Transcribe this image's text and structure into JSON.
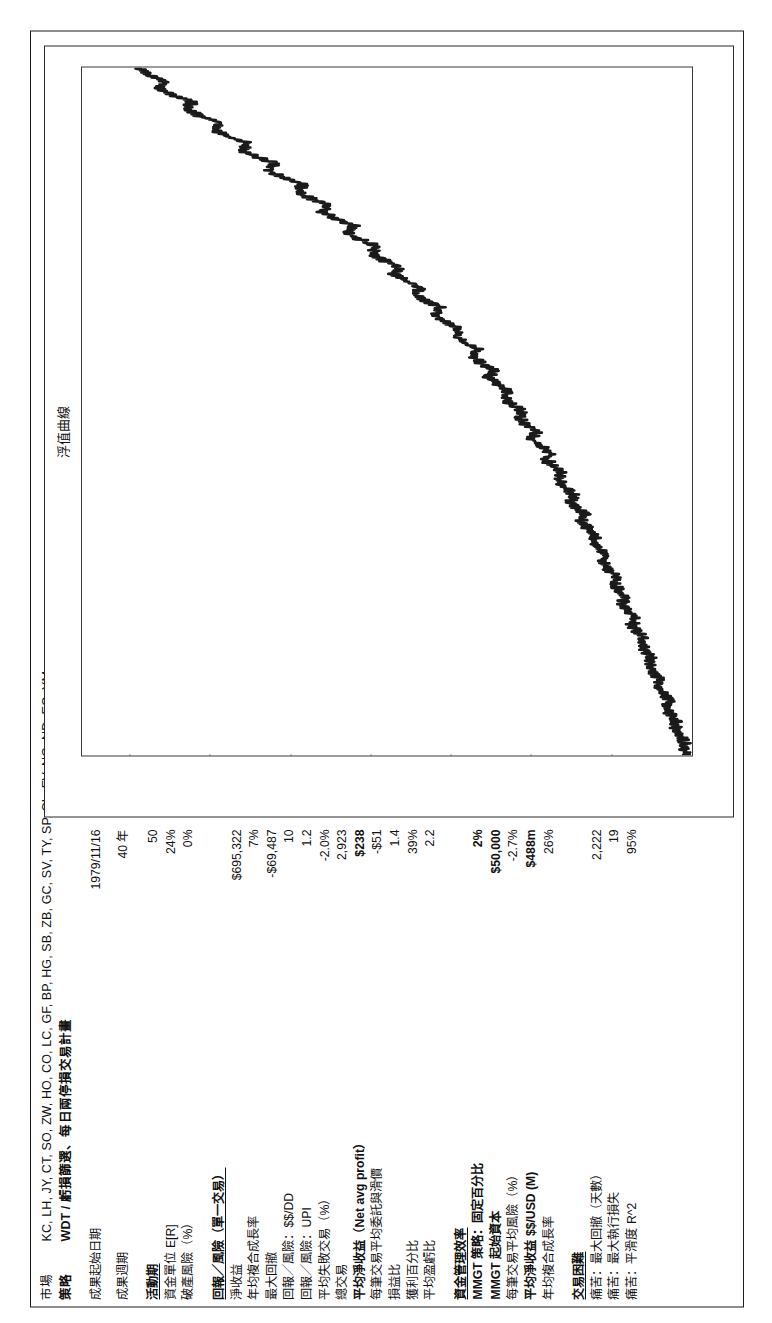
{
  "header": {
    "market_label": "市場",
    "market_value": "KC, LH, JY, CT, SO, ZW, HO, CO, LC, GF, BP, HG, SB, ZB, GC, SV, TY, SP, CL, FV, NG, ND, EC, YM",
    "strategy_label": "策略",
    "strategy_value": "WDT / 虧損篩選、每日兩停損交易計畫"
  },
  "stats": {
    "start_date": {
      "label": "成果起始日期",
      "value": "1979/11/16"
    },
    "duration": {
      "label": "成果週期",
      "value": "40 年"
    },
    "group_activity": {
      "head": {
        "label": "活動期",
        "value": "50"
      },
      "rows": [
        {
          "label": "資金單位 E[R]",
          "value": "24%"
        },
        {
          "label": "期望值 E[R]",
          "value": ""
        },
        {
          "label": "破產風險（%）",
          "value": "0%"
        }
      ]
    },
    "group_risk_head": "回報／風險（單一交易）",
    "risk_rows": [
      {
        "label": "淨收益",
        "value": "$695,322"
      },
      {
        "label": "年均複合成長率",
        "value": "7%"
      },
      {
        "label": "最大回撤",
        "value": "-$69,487"
      },
      {
        "label": "回報／風險：$$/DD",
        "value": "10"
      },
      {
        "label": "回報／風險：UPI",
        "value": "1.2"
      },
      {
        "label": "平均失敗交易（%）",
        "value": "-2.0%"
      },
      {
        "label": "總交易",
        "value": "2,923"
      },
      {
        "label": "平均淨收益（Net avg profit）",
        "value": "$238"
      },
      {
        "label": "每筆交易平均委託與滑價",
        "value": "-$51"
      },
      {
        "label": "損益比",
        "value": "1.4"
      },
      {
        "label": "獲利百分比",
        "value": "39%"
      },
      {
        "label": "平均盈虧比",
        "value": "2.2"
      }
    ],
    "group_mmgt_head": "資金管理效率",
    "mmgt_rows": [
      {
        "label": "MMGT 策略：固定百分比",
        "value": "2%"
      },
      {
        "label": "MMGT 起始資本",
        "value": "$50,000"
      },
      {
        "label": "每筆交易平均風險（%）",
        "value": "-2.7%"
      },
      {
        "label": "平均淨收益 $$/USD (M)",
        "value": "$488m"
      },
      {
        "label": "年均複合成長率",
        "value": "26%"
      }
    ],
    "group_pain_head": "交易困難",
    "pain_rows": [
      {
        "label": "痛苦：最大回撤（天數）",
        "value": "2,222"
      },
      {
        "label": "痛苦：最大執行損失",
        "value": "19"
      },
      {
        "label": "痛苦：平滑度 R^2",
        "value": "95%"
      }
    ]
  },
  "chart_data": {
    "type": "line",
    "title": "浮值曲線",
    "xlabel": "",
    "ylabel": "",
    "ylim": [
      0,
      760000
    ],
    "grid": false,
    "legend": "none",
    "ytick_labels": [
      "$0",
      "$100,000",
      "$200,000",
      "$300,000",
      "$400,000",
      "$500,000",
      "$600,000",
      "$700,000"
    ],
    "ytick_values": [
      0,
      100000,
      200000,
      300000,
      400000,
      500000,
      600000,
      700000
    ],
    "series": [
      {
        "name": "浮值曲線",
        "color": "#1a1a1a",
        "x": [
          0,
          1,
          2,
          3,
          4,
          5,
          6,
          7,
          8,
          9,
          10,
          11,
          12,
          13,
          14,
          15,
          16,
          17,
          18,
          19,
          20,
          21,
          22,
          23,
          24,
          25,
          26,
          27,
          28,
          29,
          30,
          31,
          32,
          33,
          34,
          35,
          36,
          37,
          38,
          39,
          40,
          41,
          42,
          43,
          44,
          45,
          46,
          47,
          48,
          49,
          50,
          51,
          52,
          53,
          54,
          55,
          56,
          57,
          58,
          59,
          60,
          61,
          62,
          63,
          64,
          65,
          66,
          67,
          68,
          69,
          70,
          71,
          72,
          73,
          74,
          75,
          76,
          77,
          78,
          79,
          80,
          81,
          82,
          83,
          84,
          85,
          86,
          87,
          88,
          89,
          90,
          91,
          92,
          93,
          94,
          95,
          96,
          97,
          98,
          99,
          100
        ],
        "values": [
          6000,
          11000,
          9000,
          16000,
          21000,
          18000,
          26000,
          31000,
          28000,
          36000,
          42000,
          39000,
          47000,
          52000,
          49000,
          57000,
          63000,
          60000,
          68000,
          74000,
          71000,
          80000,
          86000,
          82000,
          91000,
          97000,
          94000,
          103000,
          110000,
          106000,
          116000,
          123000,
          119000,
          129000,
          137000,
          133000,
          143000,
          151000,
          147000,
          158000,
          166000,
          161000,
          173000,
          181000,
          176000,
          189000,
          198000,
          193000,
          206000,
          215000,
          210000,
          224000,
          233000,
          228000,
          242000,
          252000,
          247000,
          262000,
          272000,
          267000,
          283000,
          294000,
          289000,
          306000,
          318000,
          312000,
          330000,
          343000,
          337000,
          356000,
          370000,
          364000,
          384000,
          398000,
          392000,
          413000,
          428000,
          421000,
          443000,
          459000,
          452000,
          475000,
          492000,
          484000,
          508000,
          526000,
          518000,
          543000,
          561000,
          553000,
          578000,
          596000,
          588000,
          613000,
          630000,
          622000,
          647000,
          663000,
          655000,
          678000,
          692000
        ]
      }
    ]
  }
}
